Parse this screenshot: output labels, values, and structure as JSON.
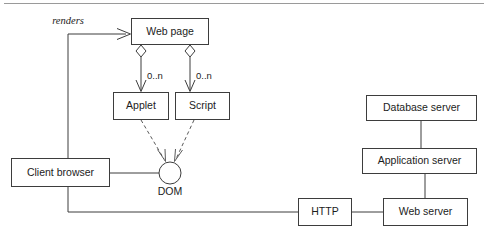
{
  "diagram": {
    "top_rule": true,
    "nodes": {
      "web_page": {
        "label": "Web page",
        "x": 131,
        "y": 18,
        "w": 78,
        "h": 27
      },
      "applet": {
        "label": "Applet",
        "x": 113,
        "y": 92,
        "w": 56,
        "h": 28
      },
      "script": {
        "label": "Script",
        "x": 175,
        "y": 92,
        "w": 55,
        "h": 28
      },
      "client_browser": {
        "label": "Client browser",
        "x": 11,
        "y": 158,
        "w": 99,
        "h": 29
      },
      "dom": {
        "label": "DOM",
        "cx": 170,
        "cy": 173,
        "r": 11,
        "label_x": 170,
        "label_y": 191
      },
      "database_server": {
        "label": "Database server",
        "x": 366,
        "y": 95,
        "w": 111,
        "h": 26
      },
      "application_server": {
        "label": "Application server",
        "x": 362,
        "y": 148,
        "w": 115,
        "h": 26
      },
      "http": {
        "label": "HTTP",
        "x": 298,
        "y": 198,
        "w": 54,
        "h": 28
      },
      "web_server": {
        "label": "Web server",
        "x": 383,
        "y": 198,
        "w": 85,
        "h": 28
      }
    },
    "edge_labels": {
      "renders": "renders",
      "applet_multiplicity": "0..n",
      "script_multiplicity": "0..n"
    },
    "colors": {
      "stroke": "#3d3d3d",
      "dashed_stroke": "#5a5a5a",
      "text": "#1c1c1c",
      "background": "#ffffff",
      "rule": "#9a9a9a"
    }
  }
}
